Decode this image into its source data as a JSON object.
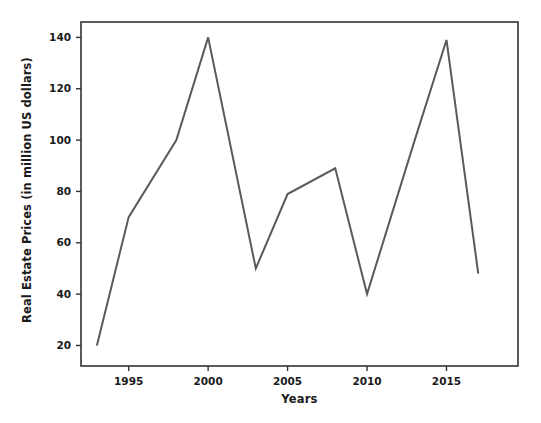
{
  "chart_data": {
    "type": "line",
    "title": "",
    "xlabel": "Years",
    "ylabel": "Real Estate Prices (in million US dollars)",
    "x": [
      1993,
      1995,
      1998,
      2000,
      2003,
      2005,
      2008,
      2010,
      2013,
      2015,
      2017
    ],
    "values": [
      20,
      70,
      100,
      140,
      50,
      79,
      89,
      40,
      100,
      139,
      48
    ],
    "series": [
      {
        "name": "Real Estate Prices",
        "values": [
          20,
          70,
          100,
          140,
          50,
          79,
          89,
          40,
          100,
          139,
          48
        ]
      }
    ],
    "xlim": [
      1992.0,
      1019.5
    ],
    "x_range": [
      1992.0,
      2019.5
    ],
    "ylim": [
      12,
      146
    ],
    "xticks": [
      1995,
      2000,
      2005,
      2010,
      2015
    ],
    "xtick_labels": [
      "1995",
      "2000",
      "2005",
      "2010",
      "2015"
    ],
    "yticks": [
      20,
      40,
      60,
      80,
      100,
      120,
      140
    ],
    "ytick_labels": [
      "20",
      "40",
      "60",
      "80",
      "100",
      "120",
      "140"
    ],
    "grid": false,
    "legend": false,
    "legend_position": "none",
    "line_color": "#5a5a5a",
    "line_width": 2,
    "frame_color": "#333333",
    "background_color": "#ffffff"
  },
  "axes": {
    "x_title": "Years",
    "y_title": "Real Estate Prices (in million US dollars)"
  }
}
